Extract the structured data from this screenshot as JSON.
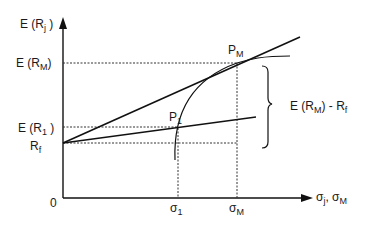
{
  "diagram": {
    "type": "CAPM / Capital Market Line diagram",
    "axes": {
      "y_label_main": "E (R",
      "y_label_sub": "j",
      "y_label_close": " )",
      "x_label_a": "σ",
      "x_label_a_sub": "j",
      "x_label_sep": ", σ",
      "x_label_b_sub": "M",
      "origin": "0"
    },
    "y_ticks": {
      "erm_main": "E (R",
      "erm_sub": "M",
      "erm_close": ")",
      "er1_main": "E (R",
      "er1_sub": "1",
      "er1_close": " )",
      "rf_main": "R",
      "rf_sub": "f"
    },
    "x_ticks": {
      "sigma1_main": "σ",
      "sigma1_sub": "1",
      "sigmaM_main": "σ",
      "sigmaM_sub": "M"
    },
    "points": {
      "pm_main": "P",
      "pm_sub": "M",
      "p1_main": "P",
      "p1_sub": "1"
    },
    "brace_label": {
      "main": "E (R",
      "sub": "M",
      "tail_main": ") - R",
      "tail_sub": "f"
    },
    "colors": {
      "line": "#111111",
      "dash": "#333333",
      "background": "#ffffff"
    }
  }
}
